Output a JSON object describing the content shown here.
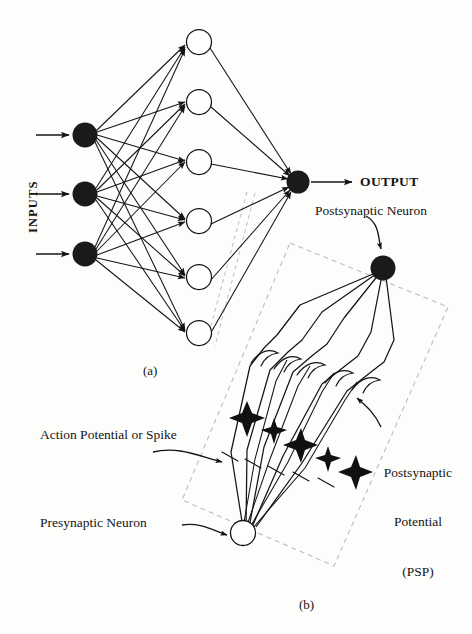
{
  "figure": {
    "title_absent": true,
    "background_color": "#fdfdfc",
    "ink_color": "#141414",
    "dashed_color": "#b9b9b9",
    "labels": {
      "inputs": "INPUTS",
      "output": "OUTPUT",
      "postsynaptic_neuron": "Postsynaptic Neuron",
      "action_potential": "Action Potential or Spike",
      "presynaptic_neuron": "Presynaptic Neuron",
      "psp_line1": "Postsynaptic",
      "psp_line2": "Potential",
      "psp_line3": "(PSP)",
      "caption_a": "(a)",
      "caption_b": "(b)"
    }
  },
  "panel_a": {
    "name": "feedforward-neural-network",
    "caption": "(a)",
    "input_layer": {
      "count": 3,
      "fill": "#1a1a1a",
      "radius": 12,
      "nodes": [
        {
          "id": "in-1",
          "cx": 85,
          "cy": 135
        },
        {
          "id": "in-2",
          "cx": 85,
          "cy": 194
        },
        {
          "id": "in-3",
          "cx": 85,
          "cy": 254
        }
      ],
      "arrows": [
        {
          "x1": 38,
          "y1": 135,
          "x2": 70,
          "y2": 135
        },
        {
          "x1": 38,
          "y1": 194,
          "x2": 70,
          "y2": 194
        },
        {
          "x1": 38,
          "y1": 254,
          "x2": 70,
          "y2": 254
        }
      ]
    },
    "hidden_layer": {
      "count": 6,
      "fill": "#ffffff",
      "stroke": "#141414",
      "radius": 12,
      "nodes": [
        {
          "id": "h-1",
          "cx": 199,
          "cy": 42
        },
        {
          "id": "h-2",
          "cx": 199,
          "cy": 102
        },
        {
          "id": "h-3",
          "cx": 199,
          "cy": 162
        },
        {
          "id": "h-4",
          "cx": 199,
          "cy": 221
        },
        {
          "id": "h-5",
          "cx": 199,
          "cy": 277
        },
        {
          "id": "h-6",
          "cx": 199,
          "cy": 333
        }
      ]
    },
    "output_layer": {
      "count": 1,
      "fill": "#1a1a1a",
      "radius": 11,
      "nodes": [
        {
          "id": "out-1",
          "cx": 298,
          "cy": 182
        }
      ],
      "arrow": {
        "x1": 312,
        "y1": 182,
        "x2": 353,
        "y2": 182
      }
    },
    "dashed_zone": [
      {
        "x": 247,
        "y": 192
      },
      {
        "x": 208,
        "y": 343
      },
      {
        "x": 216,
        "y": 345
      },
      {
        "x": 253,
        "y": 194
      }
    ]
  },
  "panel_b": {
    "name": "synapse-detail",
    "caption": "(b)",
    "postsynaptic_neuron": {
      "cx": 383,
      "cy": 268,
      "r": 12,
      "fill": "#1a1a1a"
    },
    "presynaptic_neuron": {
      "cx": 243,
      "cy": 533,
      "r": 12,
      "fill": "#ffffff"
    },
    "dashed_parallelogram": [
      {
        "x": 290,
        "y": 243
      },
      {
        "x": 447,
        "y": 306
      },
      {
        "x": 333,
        "y": 565
      },
      {
        "x": 182,
        "y": 499
      }
    ],
    "axon_branches": 5,
    "spike_markers": 5,
    "tick_marks": 5,
    "synaptic_terminals": 5,
    "callouts": [
      {
        "label": "Postsynaptic Neuron",
        "target_x": 383,
        "target_y": 250
      },
      {
        "label": "Action Potential or Spike",
        "target_x": 232,
        "target_y": 460
      },
      {
        "label": "Presynaptic Neuron",
        "target_x": 228,
        "target_y": 535
      },
      {
        "label": "Postsynaptic Potential (PSP)",
        "target_x": 352,
        "target_y": 400
      }
    ]
  }
}
